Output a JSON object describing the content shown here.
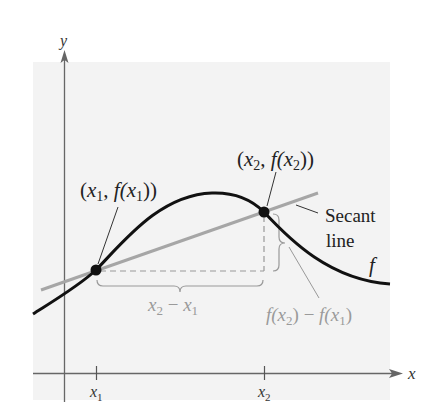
{
  "diagram": {
    "type": "secant-line-illustration",
    "axes": {
      "x_label": "x",
      "y_label": "y"
    },
    "function_label": "f",
    "points": [
      {
        "id": "p1",
        "x_var": "x",
        "x_sub": "1",
        "label_open": "(",
        "label_x": "x",
        "label_x_sub": "1",
        "label_comma": ", ",
        "label_f": "f(",
        "label_fx": "x",
        "label_fx_sub": "1",
        "label_close": "))"
      },
      {
        "id": "p2",
        "x_var": "x",
        "x_sub": "2",
        "label_open": "(",
        "label_x": "x",
        "label_x_sub": "2",
        "label_comma": ", ",
        "label_f": "f(",
        "label_fx": "x",
        "label_fx_sub": "2",
        "label_close": "))"
      }
    ],
    "tick_labels": [
      {
        "var": "x",
        "sub": "1"
      },
      {
        "var": "x",
        "sub": "2"
      }
    ],
    "secant_label_line1": "Secant",
    "secant_label_line2": "line",
    "run_label": {
      "a": "x",
      "a_sub": "2",
      "minus": " − ",
      "b": "x",
      "b_sub": "1"
    },
    "rise_label": {
      "f1": "f(",
      "a": "x",
      "a_sub": "2",
      "close1": ")",
      "minus": " − ",
      "f2": "f(",
      "b": "x",
      "b_sub": "1",
      "close2": ")"
    },
    "colors": {
      "background_panel": "#f3f3f3",
      "curve": "#111111",
      "secant": "#a6a6a6",
      "axis": "#666666",
      "annotation_gray": "#9a9a9a",
      "text": "#222222"
    }
  }
}
